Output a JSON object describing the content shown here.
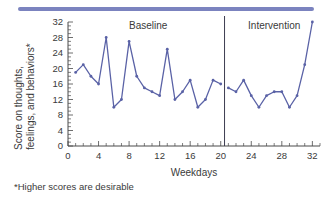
{
  "decor": {
    "top_rule_color": "#7b83bf"
  },
  "chart_data": {
    "type": "line",
    "title": "",
    "xlabel": "Weekdays",
    "ylabel": "Score on thoughts, feelings, and behaviors*",
    "ylabel_line1": "Score on thoughts,",
    "ylabel_line2": "feelings, and behaviors*",
    "footnote": "*Higher scores are desirable",
    "xlim": [
      0,
      33
    ],
    "ylim": [
      0,
      32
    ],
    "grid": false,
    "legend": "none",
    "line_color": "#5a62a6",
    "marker_color": "#5a62a6",
    "y_ticks": [
      0,
      4,
      8,
      12,
      16,
      20,
      24,
      28,
      32
    ],
    "y_tick_labels": [
      "0",
      "4",
      "8",
      "12",
      "16",
      "20",
      "24",
      "28",
      "32"
    ],
    "y_minor_tick_step": 1,
    "x_ticks": [
      0,
      4,
      8,
      12,
      16,
      20,
      24,
      28,
      32
    ],
    "x_tick_labels": [
      "0",
      "4",
      "8",
      "12",
      "16",
      "20",
      "24",
      "28",
      "32"
    ],
    "x_minor_tick_step": 1,
    "phase_change_x": 20.5,
    "phases": [
      {
        "name": "Baseline",
        "label": "Baseline",
        "label_x": 10.5,
        "x_start": 1,
        "x_end": 20
      },
      {
        "name": "Intervention",
        "label": "Intervention",
        "label_x": 27.0,
        "x_start": 21,
        "x_end": 32
      }
    ],
    "x": [
      1,
      2,
      3,
      4,
      5,
      6,
      7,
      8,
      9,
      10,
      11,
      12,
      13,
      14,
      15,
      16,
      17,
      18,
      19,
      20,
      21,
      22,
      23,
      24,
      25,
      26,
      27,
      28,
      29,
      30,
      31,
      32
    ],
    "series": [
      {
        "name": "Score on thoughts, feelings, and behaviors",
        "segments": [
          {
            "phase": "Baseline",
            "x": [
              1,
              2,
              3,
              4,
              5,
              6,
              7,
              8,
              9,
              10,
              11,
              12,
              13,
              14,
              15,
              16,
              17,
              18,
              19,
              20
            ],
            "values": [
              19,
              21,
              18,
              16,
              28,
              10,
              12,
              27,
              18,
              15,
              14,
              13,
              25,
              12,
              14,
              17,
              10,
              12,
              17,
              16
            ]
          },
          {
            "phase": "Intervention",
            "x": [
              21,
              22,
              23,
              24,
              25,
              26,
              27,
              28,
              29,
              30,
              31,
              32
            ],
            "values": [
              15,
              14,
              17,
              13,
              10,
              13,
              14,
              14,
              10,
              13,
              21,
              32
            ]
          }
        ]
      }
    ]
  }
}
